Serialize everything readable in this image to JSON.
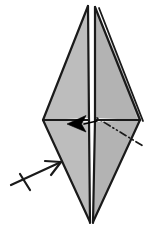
{
  "figure": {
    "kind": "origami-fold-diagram",
    "canvas": {
      "width": 149,
      "height": 228
    },
    "background_color": "#ffffff"
  },
  "colors": {
    "paper_fill": "#bdbdbd",
    "paper_fill_light": "#c8c8c8",
    "paper_fill_shadow": "#b3b3b3",
    "outline": "#1a1a1a",
    "crease_line": "#1a1a1a",
    "arrow_fill": "#000000",
    "white_gap": "#ffffff"
  },
  "geometry": {
    "top_peak_left": {
      "x": 88,
      "y": 6
    },
    "top_peak_right": {
      "x": 99,
      "y": 8
    },
    "left_vertex": {
      "x": 43,
      "y": 120
    },
    "right_vertex": {
      "x": 140,
      "y": 120
    },
    "bottom_tip": {
      "x": 91,
      "y": 223
    },
    "center_spine_x": 92,
    "horizontal_crease_y": 120
  },
  "shapes": [
    {
      "name": "upper-left-panel",
      "label": "Upper left triangular flap",
      "fill": "paper_fill",
      "points": "88,6 89,118 43,120"
    },
    {
      "name": "upper-right-panel",
      "label": "Upper right triangular flap",
      "fill": "paper_fill_shadow",
      "points": "95,7 140,120 95,118"
    },
    {
      "name": "upper-right-sliver",
      "label": "Thin raised edge sliver on right flap",
      "fill": "paper_fill_light",
      "points": "99,8 142,121 138,121"
    },
    {
      "name": "lower-left-panel",
      "label": "Lower left triangular flap",
      "fill": "paper_fill",
      "points": "43,120 89,122 90,222"
    },
    {
      "name": "lower-right-panel",
      "label": "Lower right triangular flap",
      "fill": "paper_fill_shadow",
      "points": "95,122 140,120 93,222"
    }
  ],
  "lines": [
    {
      "name": "outline-upper-left-outer",
      "type": "edge",
      "x1": 88,
      "y1": 6,
      "x2": 43,
      "y2": 120
    },
    {
      "name": "outline-upper-left-spine",
      "type": "edge",
      "x1": 88,
      "y1": 6,
      "x2": 89,
      "y2": 120
    },
    {
      "name": "outline-upper-right-spine",
      "type": "edge",
      "x1": 95,
      "y1": 7,
      "x2": 95,
      "y2": 120
    },
    {
      "name": "outline-upper-right-outer",
      "type": "edge",
      "x1": 95,
      "y1": 7,
      "x2": 140,
      "y2": 120
    },
    {
      "name": "outline-upper-right-sliver-outer",
      "type": "edge",
      "x1": 99,
      "y1": 8,
      "x2": 143,
      "y2": 121
    },
    {
      "name": "horizontal-crease-left",
      "type": "crease",
      "x1": 43,
      "y1": 120,
      "x2": 89,
      "y2": 120
    },
    {
      "name": "horizontal-crease-right",
      "type": "crease",
      "x1": 95,
      "y1": 120,
      "x2": 140,
      "y2": 120
    },
    {
      "name": "outline-lower-left-outer",
      "type": "edge",
      "x1": 43,
      "y1": 120,
      "x2": 90,
      "y2": 222
    },
    {
      "name": "outline-lower-left-spine",
      "type": "edge",
      "x1": 89,
      "y1": 120,
      "x2": 90,
      "y2": 223
    },
    {
      "name": "outline-lower-right-spine",
      "type": "edge",
      "x1": 95,
      "y1": 120,
      "x2": 93,
      "y2": 223
    },
    {
      "name": "outline-lower-right-outer",
      "type": "edge",
      "x1": 140,
      "y1": 120,
      "x2": 93,
      "y2": 222
    }
  ],
  "fold_line": {
    "name": "dash-dot-fold-line",
    "label": "Dash-dot crease (fold) guide line",
    "style": "dash-dot",
    "dash_pattern": "1 3 1 3 6 3",
    "x1": 97,
    "y1": 118,
    "x2": 143,
    "y2": 146
  },
  "arrows": [
    {
      "name": "fold-arrow-solid",
      "label": "Solid black fold-direction arrowhead pointing left",
      "style": "solid-filled",
      "direction": "left",
      "tail": {
        "x": 97,
        "y": 122
      },
      "tip": {
        "x": 68,
        "y": 124
      },
      "head_points": "68,124 84,116 80,124 84,131"
    },
    {
      "name": "push-arrow-open",
      "label": "Open V arrowhead with cross tick pointing up-right",
      "style": "open-v-with-tick",
      "direction": "up-right",
      "tail": {
        "x": 12,
        "y": 185
      },
      "tip": {
        "x": 60,
        "y": 163
      },
      "tick": {
        "x1": 20,
        "y1": 174,
        "x2": 30,
        "y2": 190
      }
    }
  ],
  "annotations": {
    "step_number": "",
    "caption": ""
  }
}
